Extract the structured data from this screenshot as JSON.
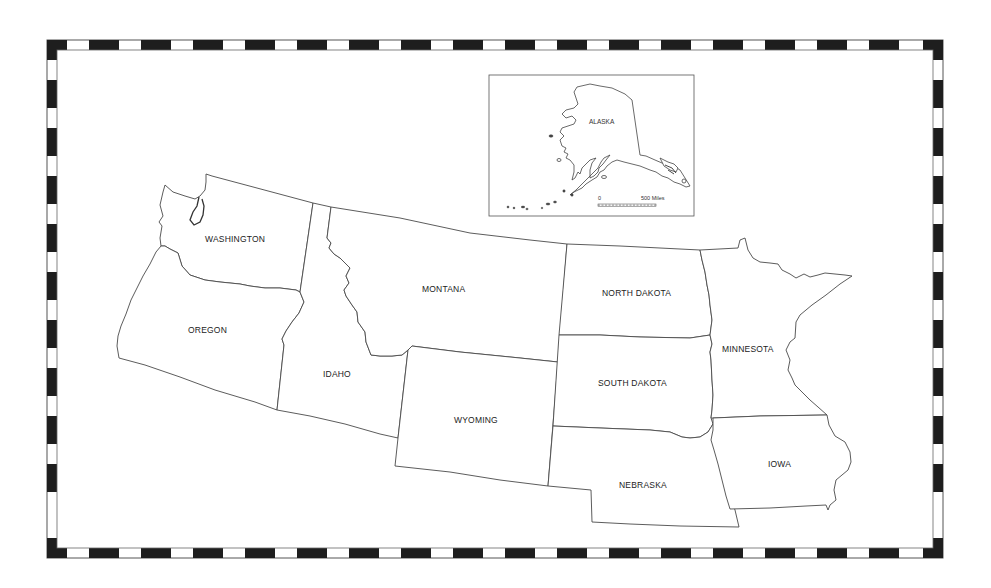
{
  "map": {
    "title": "Northwest and North-Central United States outline map",
    "frame": {
      "style": "checkered",
      "dark_color": "#1e1e1e",
      "light_color": "#ffffff"
    },
    "states": [
      {
        "id": "washington",
        "label": "WASHINGTON"
      },
      {
        "id": "oregon",
        "label": "OREGON"
      },
      {
        "id": "idaho",
        "label": "IDAHO"
      },
      {
        "id": "montana",
        "label": "MONTANA"
      },
      {
        "id": "wyoming",
        "label": "WYOMING"
      },
      {
        "id": "north-dakota",
        "label": "NORTH DAKOTA"
      },
      {
        "id": "south-dakota",
        "label": "SOUTH DAKOTA"
      },
      {
        "id": "nebraska",
        "label": "NEBRASKA"
      },
      {
        "id": "minnesota",
        "label": "MINNESOTA"
      },
      {
        "id": "iowa",
        "label": "IOWA"
      }
    ],
    "inset": {
      "label": "ALASKA",
      "scale_start": "0",
      "scale_end": "500 Miles"
    }
  }
}
